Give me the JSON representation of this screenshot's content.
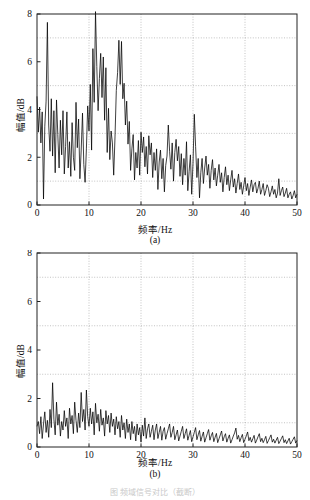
{
  "page": {
    "background": "#ffffff",
    "ink": "#111111",
    "grid_color": "#9a9a9a",
    "trace_color": "#000000",
    "partial_caption": "图    频域信号对比（截断）"
  },
  "chart_data": [
    {
      "id": "a",
      "type": "line",
      "panel_letter": "(a)",
      "title": "",
      "xlabel": "频率/Hz",
      "ylabel": "幅值/dB",
      "xlim": [
        0,
        50
      ],
      "ylim": [
        0,
        8
      ],
      "xticks": [
        0,
        10,
        20,
        30,
        40,
        50
      ],
      "yticks": [
        0,
        2,
        4,
        6,
        8
      ],
      "xgrid_values": [
        10,
        20,
        30,
        40
      ],
      "ygrid_values": [
        1,
        3,
        5,
        7
      ],
      "grid": true,
      "legend": "none",
      "x_step": 0.25,
      "values": [
        4.55,
        3.05,
        4.1,
        2.6,
        3.9,
        0.25,
        3.3,
        4.35,
        7.65,
        3.35,
        2.25,
        4.45,
        2.05,
        3.95,
        1.35,
        4.4,
        2.95,
        1.55,
        3.55,
        2.1,
        3.95,
        1.3,
        2.45,
        3.9,
        1.55,
        2.65,
        1.2,
        3.45,
        2.0,
        1.45,
        4.3,
        2.4,
        3.6,
        1.1,
        2.3,
        3.85,
        1.7,
        0.95,
        2.35,
        4.15,
        3.1,
        5.05,
        2.3,
        6.55,
        4.3,
        8.1,
        5.8,
        3.95,
        5.3,
        6.35,
        4.5,
        6.2,
        3.55,
        5.75,
        2.2,
        4.05,
        1.9,
        3.1,
        2.6,
        1.25,
        2.85,
        4.8,
        5.55,
        6.9,
        5.05,
        6.85,
        4.45,
        5.1,
        3.35,
        4.35,
        2.55,
        3.5,
        1.45,
        2.35,
        2.95,
        1.05,
        2.2,
        1.55,
        2.7,
        1.25,
        3.05,
        2.2,
        2.85,
        1.6,
        2.45,
        1.3,
        2.9,
        2.1,
        2.6,
        1.15,
        2.2,
        1.45,
        2.35,
        0.65,
        1.8,
        2.3,
        1.1,
        1.95,
        0.55,
        1.65,
        2.05,
        3.35,
        2.25,
        1.5,
        2.6,
        1.0,
        2.2,
        2.75,
        1.85,
        2.45,
        1.2,
        2.15,
        0.85,
        1.95,
        1.25,
        2.65,
        0.6,
        1.4,
        2.1,
        0.45,
        1.75,
        3.8,
        2.45,
        1.15,
        1.95,
        0.3,
        1.35,
        1.95,
        0.9,
        1.55,
        2.05,
        1.25,
        1.7,
        0.7,
        1.45,
        1.9,
        1.05,
        1.55,
        0.8,
        1.25,
        1.7,
        0.95,
        1.35,
        0.55,
        1.15,
        1.6,
        0.85,
        1.25,
        0.6,
        1.05,
        1.45,
        0.75,
        1.1,
        0.5,
        0.9,
        1.3,
        0.65,
        0.95,
        0.45,
        0.8,
        1.15,
        0.6,
        0.9,
        0.4,
        0.75,
        1.05,
        0.55,
        0.85,
        0.95,
        0.5,
        0.7,
        1.0,
        0.45,
        0.65,
        0.9,
        0.4,
        0.6,
        0.85,
        0.7,
        0.35,
        0.55,
        0.8,
        0.45,
        0.65,
        0.3,
        0.5,
        1.1,
        0.4,
        0.6,
        0.75,
        0.35,
        0.5,
        0.7,
        0.3,
        0.45,
        0.55,
        0.25,
        0.4,
        0.6,
        0.3,
        0.45,
        0.2,
        0.35,
        0.5,
        0.25,
        0.38,
        0.18,
        0.3,
        0.42,
        0.22,
        0.32,
        0.15,
        0.26,
        0.36,
        0.18,
        0.28,
        0.13,
        0.22,
        0.3,
        0.16,
        0.24,
        0.11,
        0.19,
        0.26,
        0.14,
        0.21,
        0.1,
        0.17,
        0.23,
        0.12,
        0.18,
        0.09,
        0.15,
        0.2,
        0.11,
        0.16,
        0.08,
        0.13,
        0.18,
        0.1,
        0.14,
        0.07,
        0.12,
        0.16,
        0.09,
        0.13,
        0.07,
        0.11,
        0.15,
        0.08,
        0.12,
        0.06,
        0.1,
        0.14,
        0.08,
        0.11,
        0.06,
        0.09,
        0.13,
        0.07,
        0.1,
        0.05,
        0.09,
        0.12,
        0.07,
        0.09,
        0.05,
        0.08,
        0.11,
        0.06,
        0.09,
        0.05,
        0.07,
        0.1,
        0.06,
        0.08,
        0.04,
        0.07,
        0.09,
        0.05,
        0.07,
        0.04,
        0.06,
        0.09,
        0.05,
        0.07,
        0.04,
        0.06,
        0.08,
        0.05,
        0.06,
        0.03,
        0.05,
        0.08,
        0.04,
        0.06,
        0.03,
        0.05,
        0.07,
        0.04,
        0.06,
        0.03,
        0.05,
        0.07,
        0.04,
        0.05,
        0.03,
        0.04,
        0.06,
        0.04,
        0.05,
        0.03,
        0.04,
        0.06,
        0.03,
        0.05,
        0.03,
        0.04,
        0.05,
        0.03,
        0.04,
        0.02,
        0.04,
        0.05,
        0.03,
        0.04,
        0.02,
        0.03,
        0.05,
        0.03,
        0.04,
        0.02,
        0.03,
        0.04,
        0.03,
        0.04,
        0.02,
        0.03,
        0.04,
        0.02,
        0.03,
        0.02,
        0.03,
        0.04,
        0.02,
        0.03,
        0.02,
        0.03,
        0.04,
        0.02,
        0.03,
        0.02,
        0.03,
        0.03,
        0.02,
        0.03,
        0.02,
        0.02,
        0.03,
        0.02,
        0.03,
        0.02,
        0.02,
        0.03,
        0.02,
        0.03,
        0.02,
        0.02,
        0.03,
        0.02,
        0.02,
        0.02,
        0.02,
        0.03,
        0.02,
        0.02,
        0.02,
        0.02,
        0.03,
        0.02,
        0.02,
        0.02,
        0.02,
        0.02,
        0.02,
        0.02,
        0.02,
        0.02,
        0.02,
        0.02,
        0.02,
        0.02,
        0.02,
        0.02,
        0.02,
        0.02,
        0.02,
        0.02,
        0.02,
        0.02,
        0.02
      ]
    },
    {
      "id": "b",
      "type": "line",
      "panel_letter": "(b)",
      "title": "",
      "xlabel": "频率/Hz",
      "ylabel": "幅值/dB",
      "xlim": [
        0,
        50
      ],
      "ylim": [
        0,
        8
      ],
      "xticks": [
        0,
        10,
        20,
        30,
        40,
        50
      ],
      "yticks": [
        0,
        2,
        4,
        6,
        8
      ],
      "xgrid_values": [
        10,
        20,
        30,
        40
      ],
      "ygrid_values": [
        1,
        3,
        5,
        7
      ],
      "grid": true,
      "legend": "none",
      "x_step": 0.25,
      "values": [
        0.85,
        1.05,
        0.55,
        1.25,
        0.35,
        0.95,
        1.45,
        0.6,
        1.1,
        0.4,
        1.55,
        0.8,
        2.65,
        1.15,
        0.5,
        1.85,
        0.9,
        1.35,
        0.45,
        1.05,
        0.7,
        1.5,
        0.85,
        1.2,
        0.35,
        1.6,
        0.95,
        1.3,
        0.55,
        1.85,
        1.1,
        0.6,
        1.4,
        0.8,
        2.25,
        1.05,
        1.55,
        0.7,
        2.35,
        1.25,
        0.85,
        1.6,
        0.95,
        1.45,
        0.5,
        1.8,
        1.0,
        1.35,
        0.65,
        1.55,
        0.9,
        1.2,
        0.45,
        1.5,
        0.95,
        1.3,
        0.6,
        1.4,
        0.85,
        1.15,
        0.5,
        1.25,
        0.75,
        1.05,
        0.4,
        1.3,
        0.7,
        1.0,
        0.35,
        1.15,
        0.6,
        0.95,
        0.3,
        1.05,
        0.55,
        0.85,
        0.25,
        0.95,
        0.5,
        0.8,
        0.2,
        0.9,
        0.45,
        1.2,
        0.35,
        0.75,
        0.95,
        0.4,
        0.65,
        0.9,
        0.3,
        0.7,
        0.95,
        0.35,
        0.6,
        0.85,
        0.28,
        0.65,
        0.8,
        0.32,
        0.55,
        0.75,
        0.95,
        0.4,
        0.6,
        0.85,
        0.3,
        0.5,
        0.7,
        0.25,
        0.45,
        0.65,
        0.85,
        0.35,
        0.55,
        0.75,
        0.28,
        0.48,
        0.68,
        0.22,
        0.42,
        0.6,
        0.8,
        0.3,
        0.5,
        0.68,
        0.24,
        0.44,
        0.62,
        0.2,
        0.38,
        0.55,
        0.72,
        0.28,
        0.46,
        0.6,
        0.22,
        0.4,
        0.56,
        0.18,
        0.34,
        0.5,
        0.66,
        0.25,
        0.42,
        0.55,
        0.2,
        0.36,
        0.5,
        0.16,
        0.3,
        0.45,
        0.58,
        0.78,
        0.32,
        0.48,
        0.22,
        0.38,
        0.52,
        0.18,
        0.32,
        0.46,
        0.62,
        0.26,
        0.4,
        0.2,
        0.34,
        0.48,
        0.16,
        0.28,
        0.42,
        0.55,
        0.22,
        0.36,
        0.18,
        0.3,
        0.44,
        0.15,
        0.26,
        0.38,
        0.5,
        0.2,
        0.32,
        0.16,
        0.28,
        0.4,
        0.14,
        0.24,
        0.35,
        0.46,
        0.18,
        0.3,
        0.14,
        0.25,
        0.36,
        0.12,
        0.22,
        0.32,
        0.42,
        0.16,
        0.27,
        0.12,
        0.22,
        0.3,
        0.11,
        0.2,
        0.28,
        0.38,
        0.15,
        0.24,
        0.11,
        0.19,
        0.27,
        0.1,
        0.18,
        0.25,
        0.33,
        0.13,
        0.21,
        0.1,
        0.17,
        0.24,
        0.09,
        0.16,
        0.22,
        0.29,
        0.12,
        0.19,
        0.09,
        0.15,
        0.21,
        0.08,
        0.14,
        0.19,
        0.25,
        0.1,
        0.17,
        0.08,
        0.13,
        0.18,
        0.07,
        0.12,
        0.17,
        0.22,
        0.09,
        0.15,
        0.07,
        0.12,
        0.16,
        0.06,
        0.1,
        0.14,
        0.19,
        0.08,
        0.13,
        0.06,
        0.1,
        0.14,
        0.05,
        0.09,
        0.12,
        0.16,
        0.07,
        0.11,
        0.05,
        0.08,
        0.12,
        0.04,
        0.07,
        0.1,
        0.13,
        0.06,
        0.09,
        0.04,
        0.07,
        0.1,
        0.04,
        0.06,
        0.08,
        0.11,
        0.05,
        0.07,
        0.03,
        0.05,
        0.07,
        0.03,
        0.05,
        0.06,
        0.08,
        0.04,
        0.05,
        0.03,
        0.04,
        0.05,
        0.03,
        0.04,
        0.05,
        0.06,
        0.03,
        0.04,
        0.02,
        0.03,
        0.04,
        0.02,
        0.03,
        0.04,
        0.05,
        0.03,
        0.03,
        0.02,
        0.03,
        0.03,
        0.02,
        0.02,
        0.03,
        0.04,
        0.02,
        0.03,
        0.02,
        0.02,
        0.03,
        0.02,
        0.02,
        0.03,
        0.03,
        0.02,
        0.02,
        0.02,
        0.02,
        0.03,
        0.02,
        0.02,
        0.02,
        0.03,
        0.02,
        0.02,
        0.02,
        0.02,
        0.02,
        0.02,
        0.02,
        0.02,
        0.02,
        0.02,
        0.02,
        0.02,
        0.02,
        0.02,
        0.02,
        0.02,
        0.02,
        0.02,
        0.02,
        0.02,
        0.02,
        0.02,
        0.02,
        0.02,
        0.02,
        0.02,
        0.02,
        0.02,
        0.02,
        0.02,
        0.02,
        0.02,
        0.02,
        0.02,
        0.02,
        0.02,
        0.02,
        0.02,
        0.02,
        0.02,
        0.02,
        0.02,
        0.02,
        0.02,
        0.02,
        0.02,
        0.02,
        0.02,
        0.02,
        0.02,
        0.02,
        0.02,
        0.02,
        0.02,
        0.02,
        0.02,
        0.02,
        0.02,
        0.02,
        0.02,
        0.02,
        0.02,
        0.02,
        0.02,
        0.02,
        0.02,
        0.02
      ]
    }
  ]
}
